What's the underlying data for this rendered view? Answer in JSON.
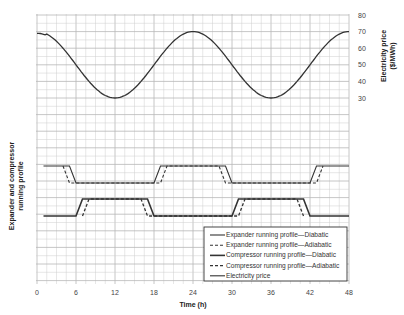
{
  "chart_data": {
    "type": "line",
    "title": "",
    "xlabel": "Time (h)",
    "ylabel_left": "Expander and compressor running profile",
    "ylabel_right": "Electricity price ($/MWh)",
    "xlim": [
      0,
      48
    ],
    "x_ticks": [
      0,
      6,
      12,
      18,
      24,
      30,
      36,
      42,
      48
    ],
    "y_right_ticks": [
      30,
      40,
      50,
      60,
      70,
      80
    ],
    "y_right_range": [
      30,
      80
    ],
    "grid": true,
    "legend_position": "lower right",
    "series": [
      {
        "name": "Expander running profile—Diabatic",
        "style": "solid",
        "points": [
          [
            1,
            1
          ],
          [
            5,
            1
          ],
          [
            6,
            0
          ],
          [
            18,
            0
          ],
          [
            19,
            1
          ],
          [
            29,
            1
          ],
          [
            30,
            0
          ],
          [
            42,
            0
          ],
          [
            43,
            1
          ],
          [
            48,
            1
          ]
        ]
      },
      {
        "name": "Expander running profile—Adiabatic",
        "style": "dashed",
        "points": [
          [
            4,
            1
          ],
          [
            5,
            0
          ],
          [
            19,
            0
          ],
          [
            20,
            1
          ],
          [
            28,
            1
          ],
          [
            29,
            0
          ],
          [
            43,
            0
          ],
          [
            44,
            1
          ]
        ]
      },
      {
        "name": "Compressor running profile—Diabatic",
        "style": "solid-thick",
        "points": [
          [
            1,
            0
          ],
          [
            6,
            0
          ],
          [
            7,
            1
          ],
          [
            17,
            1
          ],
          [
            18,
            0
          ],
          [
            30,
            0
          ],
          [
            31,
            1
          ],
          [
            41,
            1
          ],
          [
            42,
            0
          ],
          [
            48,
            0
          ]
        ]
      },
      {
        "name": "Compressor running profile—Adiabatic",
        "style": "dashed-thick",
        "points": [
          [
            7,
            0
          ],
          [
            8,
            1
          ],
          [
            16,
            1
          ],
          [
            17,
            0
          ],
          [
            31,
            0
          ],
          [
            32,
            1
          ],
          [
            40,
            1
          ],
          [
            41,
            0
          ]
        ]
      },
      {
        "name": "Electricity price",
        "style": "solid",
        "axis": "right",
        "x": [
          0,
          3,
          6,
          9,
          12,
          15,
          18,
          21,
          24,
          27,
          30,
          33,
          36,
          39,
          42,
          45,
          48
        ],
        "values": [
          69,
          64,
          50,
          36,
          30,
          36,
          50,
          64,
          70,
          64,
          50,
          36,
          30,
          36,
          50,
          64,
          70
        ]
      }
    ]
  },
  "axes": {
    "x_title": "Time (h)",
    "left_title_line1": "Expander and compressor",
    "left_title_line2": "running profile",
    "right_title_line1": "Electricity price",
    "right_title_line2": "($/MWh)"
  },
  "legend": {
    "items": [
      "Expander running profile—Diabatic",
      "Expander running profile—Adiabatic",
      "Compressor running profile—Diabatic",
      "Compressor running profile—Adiabatic",
      "Electricity price"
    ]
  },
  "colors": {
    "line": "#333333",
    "grid": "#cfcfcf",
    "grid_major": "#b8b8b8"
  }
}
